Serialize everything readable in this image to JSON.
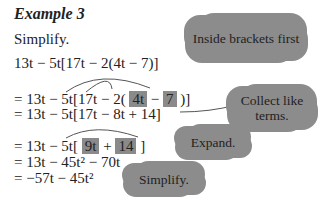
{
  "title": "Example 3",
  "instruction": "Simplify.",
  "lines": [
    {
      "text": "13t − 5t[17t − 2(4t − 7)]"
    },
    {
      "pre": "= 13t − 5t[17t − 2( ",
      "h1": "4t",
      "mid": " − ",
      "h2": "7",
      "post": " )]"
    },
    {
      "text": "= 13t − 5t[17t − 8t + 14]"
    },
    {
      "pre": "= 13t − 5t[ ",
      "h1": "9t",
      "mid": " + ",
      "h2": "14",
      "post": " ]"
    },
    {
      "text": "= 13t − 45t² − 70t"
    },
    {
      "text": "= −57t − 45t²"
    }
  ],
  "callouts": [
    {
      "text": "Inside brackets first"
    },
    {
      "text": "Collect like terms."
    },
    {
      "text": "Expand."
    },
    {
      "text": "Simplify."
    }
  ],
  "colors": {
    "highlight": "#8a8a8a",
    "cloud": "#8c8c8c",
    "arrow": "#555555"
  }
}
